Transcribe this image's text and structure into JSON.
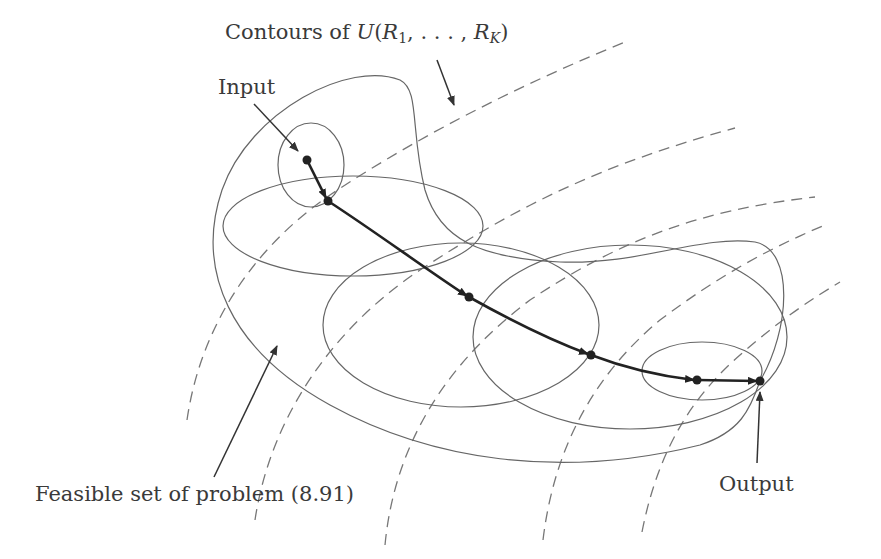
{
  "figure": {
    "labels": {
      "contours_prefix": "Contours of ",
      "contours_func": "U",
      "contours_open": "(",
      "contours_r": "R",
      "contours_sub1": "1",
      "contours_mid": ", . . . , ",
      "contours_r2": "R",
      "contours_subk": "K",
      "contours_close": ")",
      "input": "Input",
      "output": "Output",
      "feasible_set": "Feasible set of problem (8.91)"
    },
    "iterates": [
      {
        "x": 307,
        "y": 160
      },
      {
        "x": 328,
        "y": 201
      },
      {
        "x": 469,
        "y": 297
      },
      {
        "x": 591,
        "y": 355
      },
      {
        "x": 697,
        "y": 380
      },
      {
        "x": 760,
        "y": 381
      }
    ],
    "colors": {
      "path": "#222222",
      "region": "#666666",
      "contour": "#777777",
      "text": "#3a3a3a"
    }
  }
}
